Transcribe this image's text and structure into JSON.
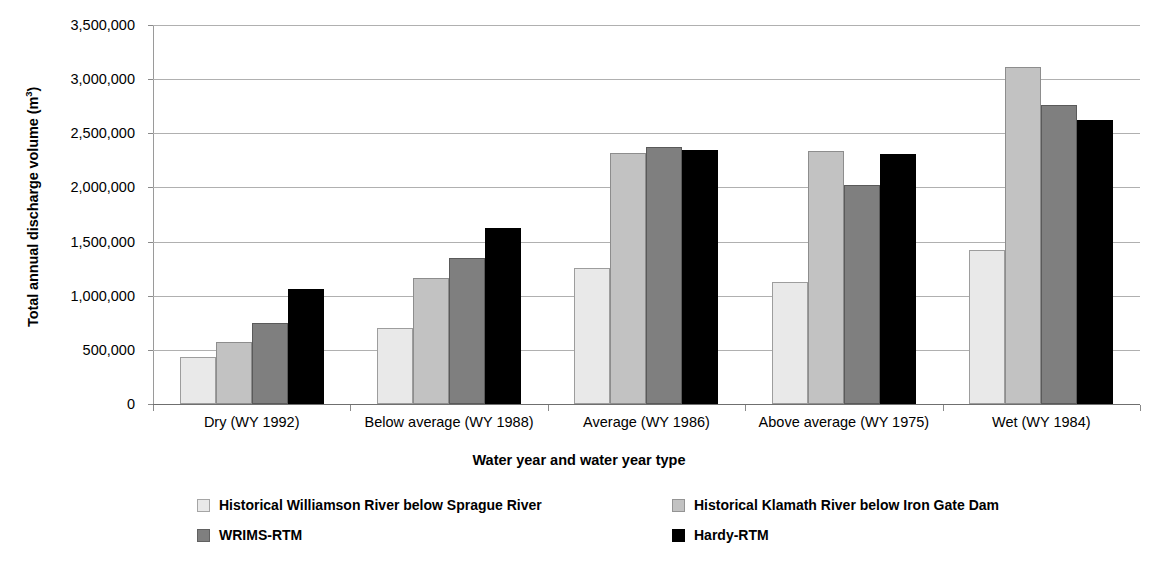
{
  "chart_data": {
    "type": "bar",
    "title": "",
    "xlabel": "Water year and water year type",
    "ylabel": "Total annual discharge volume (m3)",
    "ylabel_html": "Total annual discharge volume (m³)",
    "ylim": [
      0,
      3500000
    ],
    "ytick_step": 500000,
    "ytick_labels": [
      "3,500,000",
      "3,000,000",
      "2,500,000",
      "2,000,000",
      "1,500,000",
      "1,000,000",
      "500,000",
      "0"
    ],
    "ytick_values": [
      3500000,
      3000000,
      2500000,
      2000000,
      1500000,
      1000000,
      500000,
      0
    ],
    "grid": true,
    "legend_position": "bottom",
    "categories": [
      "Dry (WY 1992)",
      "Below average (WY 1988)",
      "Average (WY 1986)",
      "Above average (WY 1975)",
      "Wet (WY 1984)"
    ],
    "series": [
      {
        "name": "Historical Williamson River below Sprague River",
        "color": "#e9e9e9",
        "values": [
          435000,
          700000,
          1260000,
          1125000,
          1425000
        ]
      },
      {
        "name": "Historical Klamath River below Iron Gate Dam",
        "color": "#c2c2c2",
        "values": [
          575000,
          1165000,
          2315000,
          2340000,
          3110000
        ]
      },
      {
        "name": "WRIMS-RTM",
        "color": "#7f7f7f",
        "values": [
          745000,
          1345000,
          2370000,
          2020000,
          2765000
        ]
      },
      {
        "name": "Hardy-RTM",
        "color": "#000000",
        "values": [
          1060000,
          1630000,
          2345000,
          2310000,
          2625000
        ]
      }
    ]
  },
  "legend": {
    "items": [
      "Historical Williamson River below Sprague River",
      "Historical Klamath River below Iron Gate Dam",
      "WRIMS-RTM",
      "Hardy-RTM"
    ]
  },
  "axes": {
    "x_title": "Water year and water year type",
    "y_title_main": "Total annual discharge volume (m",
    "y_title_sup": "3",
    "y_title_tail": ")"
  }
}
